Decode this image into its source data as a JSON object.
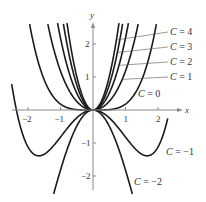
{
  "chart_data": {
    "type": "line",
    "title": "",
    "xlabel": "x",
    "ylabel": "y",
    "xlim": [
      -2.6,
      2.7
    ],
    "ylim": [
      -2.7,
      2.8
    ],
    "grid": false,
    "legend_position": "inline labels on right",
    "x_ticks": [
      -2,
      -1,
      1,
      2
    ],
    "x_tick_labels": [
      "-2",
      "-1",
      "1",
      "2"
    ],
    "y_ticks": [
      -2,
      -1,
      1,
      2
    ],
    "y_tick_labels": [
      "-2",
      "-1",
      "1",
      "2"
    ],
    "family_formula": "y = C*x^2 + 0.18*x^4",
    "series": [
      {
        "name": "C = 4",
        "C": 4,
        "label_pos": [
          170,
          35
        ],
        "leader_from_x": 0.72
      },
      {
        "name": "C = 3",
        "C": 3,
        "label_pos": [
          170,
          50
        ],
        "leader_from_x": 0.75
      },
      {
        "name": "C = 2",
        "C": 2,
        "label_pos": [
          170,
          65
        ],
        "leader_from_x": 0.8
      },
      {
        "name": "C = 1",
        "C": 1,
        "label_pos": [
          170,
          80
        ],
        "leader_from_x": 0.9
      },
      {
        "name": "C = 0",
        "C": 0,
        "label_pos": [
          138,
          97
        ],
        "leader_from_x": null
      },
      {
        "name": "C = -1",
        "C": -1,
        "label_pos": [
          166,
          155
        ],
        "leader_from_x": null
      },
      {
        "name": "C = -2",
        "C": -2,
        "label_pos": [
          134,
          185
        ],
        "leader_from_x": null
      }
    ],
    "x_range_left": -2.5,
    "x_range_right": 2.3
  },
  "axes": {
    "x_label": "x",
    "y_label": "y"
  }
}
